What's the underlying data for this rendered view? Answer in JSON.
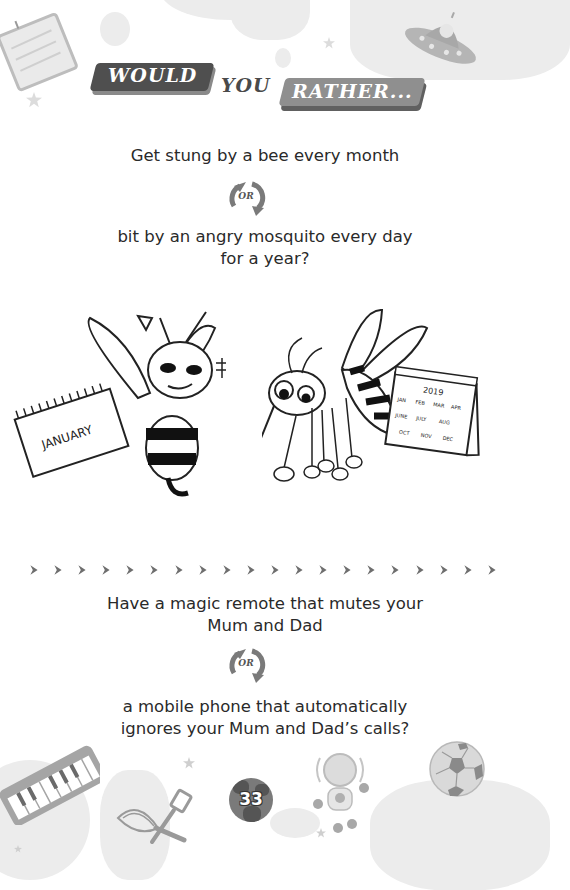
{
  "header": {
    "title_parts": [
      "WOULD",
      "YOU",
      "RATHER..."
    ]
  },
  "questions": [
    {
      "option_a": "Get stung by a bee every month",
      "or_label": "OR",
      "option_b_line1": "bit by an angry mosquito every day",
      "option_b_line2": "for a year?"
    },
    {
      "option_a_line1": "Have a magic remote that mutes your",
      "option_a_line2": "Mum and Dad",
      "or_label": "OR",
      "option_b_line1": "a mobile phone that automatically",
      "option_b_line2": "ignores your Mum and Dad’s calls?"
    }
  ],
  "illustrations": {
    "bee_calendar": "JANUARY",
    "mosquito_calendar": {
      "year": "2019",
      "months": [
        "JAN",
        "FEB",
        "MAR",
        "APR",
        "JUNE",
        "JULY",
        "AUG",
        "OCT",
        "NOV",
        "DEC"
      ]
    }
  },
  "divider": {
    "count": 20,
    "glyph": "chevron-right"
  },
  "footer": {
    "page_number": "33"
  },
  "colors": {
    "dark_plate": "#4f4f4f",
    "light_plate": "#8f8f8f",
    "text": "#2a2a2a",
    "icon_gray": "#7a7a7a",
    "decor_gray": "#ececec"
  }
}
